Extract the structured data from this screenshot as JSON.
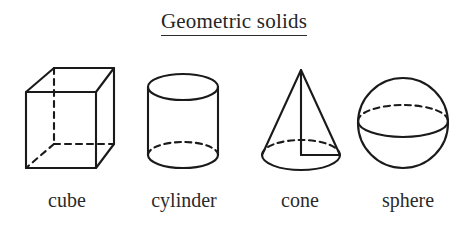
{
  "page": {
    "title": "Geometric solids",
    "background_color": "#ffffff",
    "ink_color": "#1a1a1a",
    "width": 468,
    "height": 228
  },
  "figure": {
    "kind": "line-drawing-diagram",
    "subject": "geometric solids",
    "title_underlined": true,
    "item_count": 4
  },
  "solids": [
    {
      "id": "cube",
      "label": "cube",
      "icon": "cube-icon",
      "visible_edges": "solid",
      "hidden_edges": "dashed",
      "description": "Wireframe cube drawn in oblique projection with three dashed hidden edges meeting at the rear lower-left vertex."
    },
    {
      "id": "cylinder",
      "label": "cylinder",
      "icon": "cylinder-icon",
      "visible_edges": "solid",
      "hidden_edges": "dashed",
      "description": "Upright cylinder with full elliptical top, two vertical sides, solid front base arc and dashed rear base arc."
    },
    {
      "id": "cone",
      "label": "cone",
      "icon": "cone-icon",
      "visible_edges": "solid",
      "hidden_edges": "dashed",
      "description": "Right circular cone with apex at top, solid front base arc, dashed rear base arc, vertical axis and horizontal radius drawn inside."
    },
    {
      "id": "sphere",
      "label": "sphere",
      "icon": "sphere-icon",
      "visible_edges": "solid",
      "hidden_edges": "dashed",
      "description": "Circle with an equator ellipse: solid front half and dashed rear half."
    }
  ]
}
